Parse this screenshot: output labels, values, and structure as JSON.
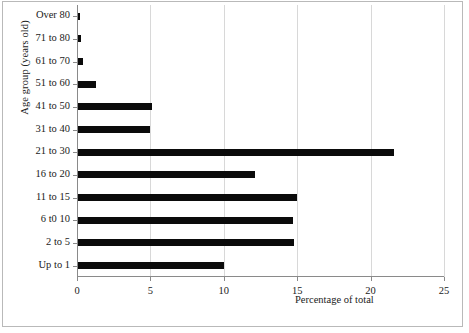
{
  "chart_data": {
    "type": "bar",
    "orientation": "horizontal",
    "title": "",
    "xlabel": "Percentage of total",
    "ylabel": "Age group (years old)",
    "xlim": [
      0,
      25
    ],
    "xticks": [
      0,
      5,
      10,
      15,
      20,
      25
    ],
    "xticklabels": [
      "0",
      "5",
      "10",
      "15",
      "20",
      "25"
    ],
    "grid": true,
    "grid_axis": "x",
    "legend": false,
    "bar_color": "#0b0b0b",
    "grid_color": "#d8d8d8",
    "axis_color": "#8a8a8a",
    "categories": [
      "Over 80",
      "71 to 80",
      "61 to 70",
      "51 to 60",
      "41 to 50",
      "31 to 40",
      "21 to 30",
      "16 to 20",
      "11 to 15",
      "6 t0 10",
      "2 to 5",
      "Up to 1"
    ],
    "values": [
      0.2,
      0.3,
      0.4,
      1.3,
      5.1,
      5.0,
      21.6,
      12.1,
      15.0,
      14.7,
      14.8,
      10.0
    ]
  }
}
